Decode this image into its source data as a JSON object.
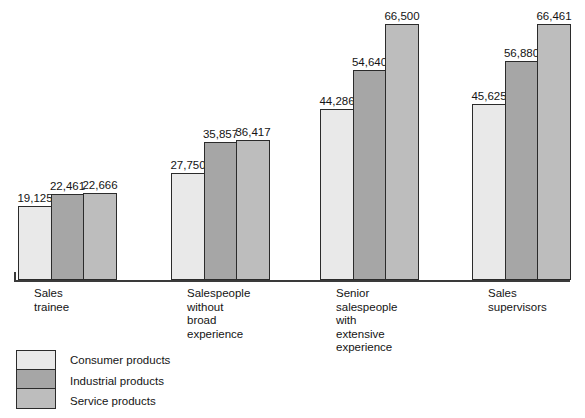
{
  "chart_data": {
    "type": "bar",
    "title": "",
    "subtitle": "",
    "xlabel": "",
    "ylabel": "",
    "ylim": [
      0,
      70000
    ],
    "grid": false,
    "legend_position": "bottom-left",
    "orientation": "vertical",
    "grouping": "grouped",
    "value_label_format": "comma-separated integers",
    "categories": [
      "Sales\ntrainee",
      "Salespeople\nwithout\nbroad\nexperience",
      "Senior\nsalespeople\nwith\nextensive\nexperience",
      "Sales\nsupervisors"
    ],
    "series": [
      {
        "name": "Consumer products",
        "color": "#e9e9e9",
        "values": [
          19125,
          22461,
          44286,
          45625
        ],
        "labels": [
          "19,125",
          "22,461",
          "44,286",
          "45,625"
        ]
      },
      {
        "name": "Industrial products",
        "color": "#a6a6a6",
        "values": [
          22461,
          35857,
          54640,
          56880
        ],
        "labels": [
          "22,461",
          "35,857",
          "54,640",
          "56,880"
        ]
      },
      {
        "name": "Service products",
        "color": "#bdbdbd",
        "values": [
          22666,
          36417,
          66500,
          66461
        ],
        "labels": [
          "22,666",
          "36,417",
          "66,500",
          "66,461"
        ]
      }
    ],
    "groups": [
      {
        "category": "Sales\ntrainee",
        "bars": [
          {
            "series": "Consumer products",
            "value": 19125,
            "label": "19,125"
          },
          {
            "series": "Industrial products",
            "value": 22461,
            "label": "22,461"
          },
          {
            "series": "Service products",
            "value": 22666,
            "label": "22,666"
          }
        ]
      },
      {
        "category": "Salespeople\nwithout\nbroad\nexperience",
        "bars": [
          {
            "series": "Consumer products",
            "value": 27750,
            "label": "27,750"
          },
          {
            "series": "Industrial products",
            "value": 35857,
            "label": "35,857"
          },
          {
            "series": "Service products",
            "value": 36417,
            "label": "36,417"
          }
        ]
      },
      {
        "category": "Senior\nsalespeople\nwith\nextensive\nexperience",
        "bars": [
          {
            "series": "Consumer products",
            "value": 44286,
            "label": "44,286"
          },
          {
            "series": "Industrial products",
            "value": 54640,
            "label": "54,640"
          },
          {
            "series": "Service products",
            "value": 66500,
            "label": "66,500"
          }
        ]
      },
      {
        "category": "Sales\nsupervisors",
        "bars": [
          {
            "series": "Consumer products",
            "value": 45625,
            "label": "45,625"
          },
          {
            "series": "Industrial products",
            "value": 56880,
            "label": "56,880"
          },
          {
            "series": "Service products",
            "value": 66461,
            "label": "66,461"
          }
        ]
      }
    ],
    "legend": [
      {
        "label": "Consumer products",
        "color": "#e9e9e9"
      },
      {
        "label": "Industrial products",
        "color": "#a6a6a6"
      },
      {
        "label": "Service products",
        "color": "#bdbdbd"
      }
    ]
  },
  "layout": {
    "group_x": [
      18,
      171,
      320,
      472
    ],
    "bar_width": 34,
    "baseline_y": 280,
    "px_per_unit": 0.00385,
    "axis_left": 14,
    "axis_right": 570
  }
}
